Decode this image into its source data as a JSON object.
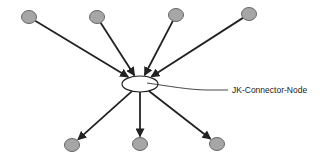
{
  "diagram": {
    "type": "hub-and-spoke network",
    "hub": {
      "id": "hub",
      "label": "JK-Connector-Node",
      "shape": "ellipse",
      "fill": "#ffffff"
    },
    "incoming_nodes": [
      {
        "id": "in-1"
      },
      {
        "id": "in-2"
      },
      {
        "id": "in-3"
      },
      {
        "id": "in-4"
      }
    ],
    "outgoing_nodes": [
      {
        "id": "out-1"
      },
      {
        "id": "out-2"
      },
      {
        "id": "out-3"
      }
    ],
    "edges": [
      {
        "from": "in-1",
        "to": "hub"
      },
      {
        "from": "in-2",
        "to": "hub"
      },
      {
        "from": "in-3",
        "to": "hub"
      },
      {
        "from": "in-4",
        "to": "hub"
      },
      {
        "from": "hub",
        "to": "out-1"
      },
      {
        "from": "hub",
        "to": "out-2"
      },
      {
        "from": "hub",
        "to": "out-3"
      }
    ],
    "colors": {
      "node_fill": "#a6a6a6",
      "node_stroke": "#666666",
      "edge": "#222222"
    }
  }
}
